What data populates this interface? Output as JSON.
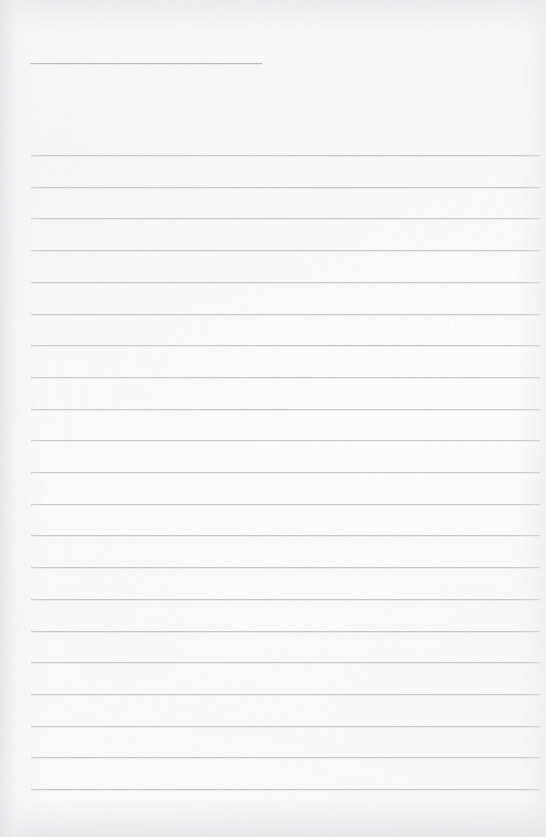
{
  "page": {
    "kind": "ruled-notepaper",
    "title": "",
    "width": 546,
    "height": 837,
    "background_color": "#fcfcfd",
    "rule_color": "#c9c9cd",
    "title_rule_color": "#b9b9be",
    "body_text": ""
  },
  "title_rule": {
    "name": "title-rule",
    "label": "",
    "x_start": 30,
    "x_end": 262,
    "y": 63,
    "width": 232,
    "thickness": 1
  },
  "ruled_area": {
    "x_start": 31,
    "x_end": 540,
    "line_width": 509,
    "first_line_y": 155,
    "last_line_y": 789,
    "line_spacing": 31.7,
    "line_count": 21,
    "thickness": 1
  },
  "lines": [
    {
      "index": 1,
      "y": 155,
      "text": ""
    },
    {
      "index": 2,
      "y": 186.7,
      "text": ""
    },
    {
      "index": 3,
      "y": 218.4,
      "text": ""
    },
    {
      "index": 4,
      "y": 250.1,
      "text": ""
    },
    {
      "index": 5,
      "y": 281.8,
      "text": ""
    },
    {
      "index": 6,
      "y": 313.5,
      "text": ""
    },
    {
      "index": 7,
      "y": 345.2,
      "text": ""
    },
    {
      "index": 8,
      "y": 376.9,
      "text": ""
    },
    {
      "index": 9,
      "y": 408.6,
      "text": ""
    },
    {
      "index": 10,
      "y": 440.3,
      "text": ""
    },
    {
      "index": 11,
      "y": 472.0,
      "text": ""
    },
    {
      "index": 12,
      "y": 503.7,
      "text": ""
    },
    {
      "index": 13,
      "y": 535.4,
      "text": ""
    },
    {
      "index": 14,
      "y": 567.1,
      "text": ""
    },
    {
      "index": 15,
      "y": 598.8,
      "text": ""
    },
    {
      "index": 16,
      "y": 630.5,
      "text": ""
    },
    {
      "index": 17,
      "y": 662.2,
      "text": ""
    },
    {
      "index": 18,
      "y": 693.9,
      "text": ""
    },
    {
      "index": 19,
      "y": 725.6,
      "text": ""
    },
    {
      "index": 20,
      "y": 757.3,
      "text": ""
    },
    {
      "index": 21,
      "y": 789.0,
      "text": ""
    }
  ],
  "margins": {
    "left": 31,
    "right": 6,
    "top": 155,
    "bottom": 48
  }
}
